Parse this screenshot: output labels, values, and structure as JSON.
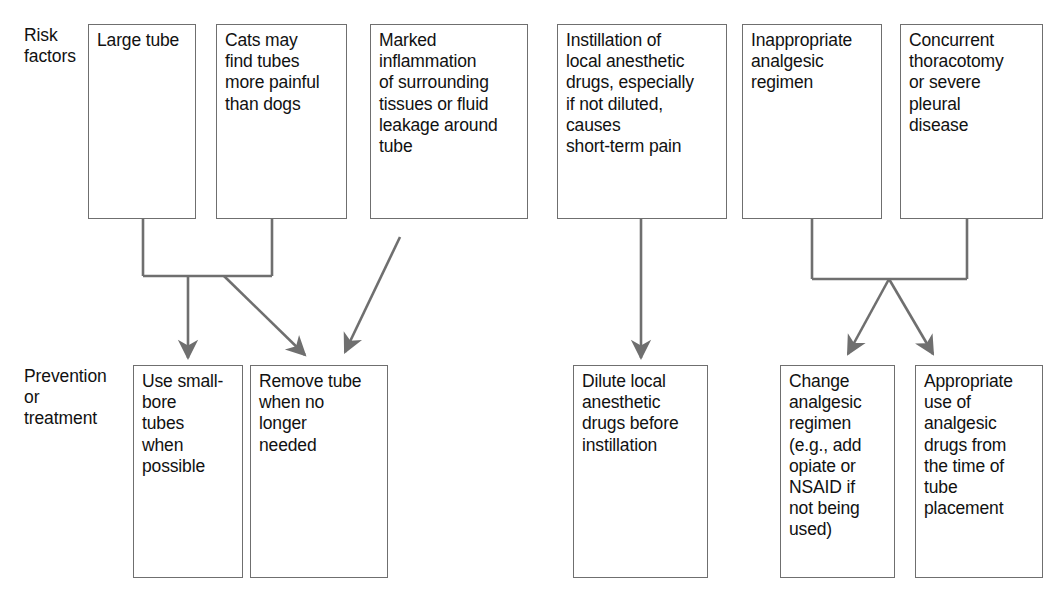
{
  "diagram": {
    "line_color": "#6f6f6f",
    "text_color": "#111111",
    "background": "#ffffff",
    "row_labels": [
      {
        "id": "risk-factors",
        "text": "Risk\nfactors"
      },
      {
        "id": "prevention-or-treatment",
        "text": "Prevention\nor\ntreatment"
      }
    ],
    "risk_factor_boxes": [
      {
        "id": "large-tube",
        "text": "Large tube"
      },
      {
        "id": "cats-more-painful",
        "text": "Cats may\nfind tubes\nmore painful\nthan dogs"
      },
      {
        "id": "marked-inflammation",
        "text": "Marked\ninflammation\nof surrounding\ntissues or fluid\nleakage around\ntube"
      },
      {
        "id": "instillation-local-anesthetic",
        "text": "Instillation of\nlocal anesthetic\ndrugs, especially\nif not diluted,\ncauses\nshort-term pain"
      },
      {
        "id": "inappropriate-analgesic-regimen",
        "text": "Inappropriate\nanalgesic\nregimen"
      },
      {
        "id": "concurrent-thoracotomy",
        "text": "Concurrent\nthoracotomy\nor severe\npleural\ndisease"
      }
    ],
    "treatment_boxes": [
      {
        "id": "use-small-bore-tubes",
        "text": "Use small-\nbore\ntubes\nwhen\npossible"
      },
      {
        "id": "remove-tube-when-no-longer-needed",
        "text": "Remove tube\nwhen no\nlonger\nneeded"
      },
      {
        "id": "dilute-local-anesthetic",
        "text": "Dilute local\nanesthetic\ndrugs before\ninstillation"
      },
      {
        "id": "change-analgesic-regimen",
        "text": "Change\nanalgesic\nregimen\n(e.g., add\nopiate or\nNSAID if\nnot being\nused)"
      },
      {
        "id": "appropriate-use-analgesic",
        "text": "Appropriate\nuse of\nanalgesic\ndrugs from\nthe time of\ntube\nplacement"
      }
    ],
    "connections": [
      {
        "id": "large-tube-to-small-bore",
        "from": "large-tube",
        "to": "use-small-bore-tubes",
        "style": "bracket-vertical-arrow"
      },
      {
        "id": "cats-to-remove-tube",
        "from": "cats-more-painful",
        "to": "remove-tube-when-no-longer-needed",
        "style": "bracket-diagonal-arrow"
      },
      {
        "id": "inflammation-to-remove-tube",
        "from": "marked-inflammation",
        "to": "remove-tube-when-no-longer-needed",
        "style": "diagonal-arrow"
      },
      {
        "id": "instillation-to-dilute",
        "from": "instillation-local-anesthetic",
        "to": "dilute-local-anesthetic",
        "style": "vertical-arrow"
      },
      {
        "id": "analgesic-regimen-to-change-regimen",
        "from": "inappropriate-analgesic-regimen",
        "to": "change-analgesic-regimen",
        "style": "bracket-diagonal-arrow"
      },
      {
        "id": "thoracotomy-to-appropriate-use",
        "from": "concurrent-thoracotomy",
        "to": "appropriate-use-analgesic",
        "style": "bracket-diagonal-arrow"
      }
    ]
  }
}
